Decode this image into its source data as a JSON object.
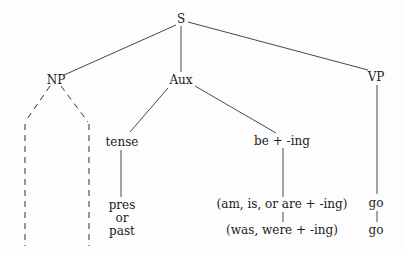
{
  "tree": {
    "root": "S",
    "level1": {
      "np": "NP",
      "aux": "Aux",
      "vp": "VP"
    },
    "aux_children": {
      "tense": "tense",
      "be_ing": "be + -ing"
    },
    "tense_values": {
      "line1": "pres",
      "line2": "or",
      "line3": "past"
    },
    "be_ing_values": {
      "present": "(am, is, or are + -ing)",
      "past": "(was, were + -ing)"
    },
    "vp_values": {
      "present": "go",
      "past": "go"
    }
  },
  "colors": {
    "line": "#333333",
    "text": "#1a1a1a",
    "background": "#fdfdfd"
  }
}
